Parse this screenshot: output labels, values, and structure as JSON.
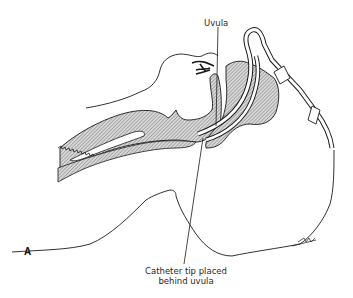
{
  "figure": {
    "panel_letter": "A",
    "labels": {
      "uvula": "Uvula",
      "catheter_line1": "Catheter tip placed",
      "catheter_line2": "behind uvula"
    },
    "signature": "sketch-signature",
    "colors": {
      "line": "#1a1a1a",
      "hatch": "#9a9a9a",
      "background": "#ffffff"
    }
  }
}
